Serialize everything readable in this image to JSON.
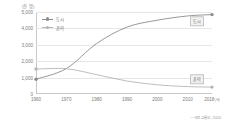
{
  "chart_data": {
    "type": "line",
    "title": "",
    "unit_label": "(천 명)",
    "xlabel": "",
    "ylabel": "",
    "x": [
      1960,
      1970,
      1980,
      1990,
      2000,
      2010,
      2018
    ],
    "x_tick_labels": [
      "1960",
      "1970",
      "1980",
      "1990",
      "2000",
      "2010",
      "2018"
    ],
    "x_last_suffix": "(년)",
    "xlim": [
      1960,
      2018
    ],
    "ylim": [
      0,
      5000
    ],
    "y_ticks": [
      0,
      1000,
      2000,
      3000,
      4000,
      5000
    ],
    "y_tick_labels": [
      "0",
      "1,000",
      "2,000",
      "3,000",
      "4,000",
      "5,000"
    ],
    "grid": true,
    "legend_position": "top-left-inside",
    "series": [
      {
        "name": "도시",
        "color": "#8c8c8c",
        "values": [
          900,
          1550,
          3080,
          4080,
          4500,
          4760,
          4840
        ]
      },
      {
        "name": "촌락",
        "color": "#b5b5b5",
        "values": [
          1520,
          1540,
          1180,
          790,
          560,
          450,
          420
        ]
      }
    ],
    "annotations": [
      {
        "text": "도시",
        "x": 2013,
        "y": 4430
      },
      {
        "text": "촌락",
        "x": 2013,
        "y": 900
      }
    ],
    "source": "─ 국토 교통부, 2020"
  }
}
